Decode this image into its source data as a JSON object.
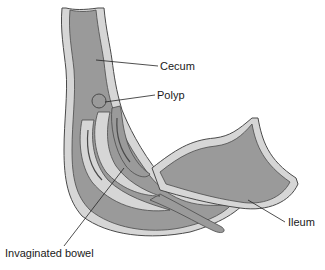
{
  "diagram": {
    "labels": {
      "cecum": "Cecum",
      "polyp": "Polyp",
      "ileum": "Ileum",
      "invaginated_bowel": "Invaginated bowel"
    },
    "colors": {
      "lumen": "#9a9a9a",
      "wall": "#d6d6d6",
      "outline": "#4a4a4a",
      "leader": "#222222",
      "background": "#ffffff"
    }
  }
}
